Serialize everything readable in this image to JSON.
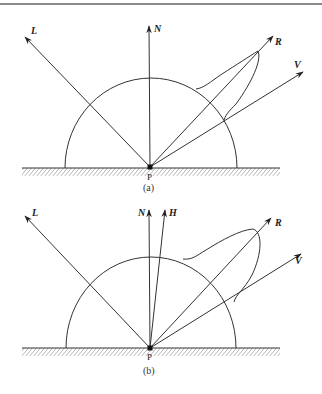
{
  "figure": {
    "top_rule": true,
    "panels": [
      {
        "caption": "(a)",
        "point_label": "P",
        "vectors": [
          {
            "name": "L",
            "label": "L"
          },
          {
            "name": "N",
            "label": "N"
          },
          {
            "name": "R",
            "label": "R"
          },
          {
            "name": "V",
            "label": "V"
          }
        ],
        "description": "Phong specular reflection lobe centered on reflection vector R"
      },
      {
        "caption": "(b)",
        "point_label": "P",
        "vectors": [
          {
            "name": "L",
            "label": "L"
          },
          {
            "name": "N",
            "label": "N"
          },
          {
            "name": "H",
            "label": "H"
          },
          {
            "name": "R",
            "label": "R"
          },
          {
            "name": "V",
            "label": "V"
          }
        ],
        "description": "Blinn-Phong specular lobe using halfway vector H"
      }
    ]
  },
  "colors": {
    "line": "#333333",
    "background": "#ffffff"
  }
}
